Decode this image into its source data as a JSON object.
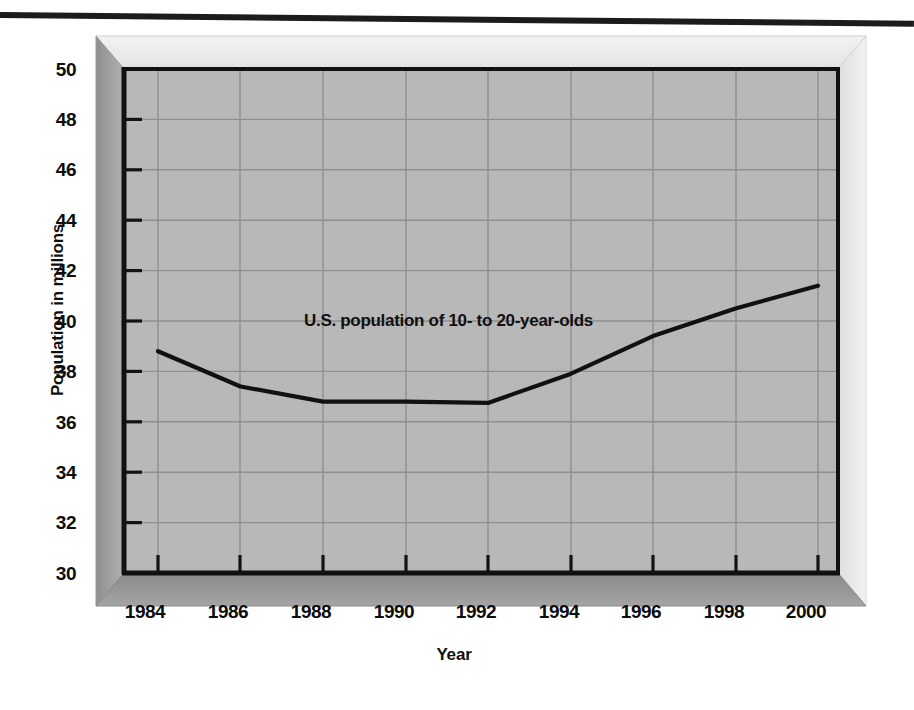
{
  "chart_data": {
    "type": "line",
    "title": "",
    "subtitle": "",
    "xlabel": "Year",
    "ylabel": "Population in millions",
    "x": [
      1984,
      1986,
      1988,
      1990,
      1992,
      1994,
      1996,
      1998,
      2000
    ],
    "xtick_labels": [
      "1984",
      "1986",
      "1988",
      "1990",
      "1992",
      "1994",
      "1996",
      "1998",
      "2000"
    ],
    "ytick_labels": [
      "50",
      "48",
      "46",
      "44",
      "42",
      "40",
      "38",
      "36",
      "34",
      "32",
      "30"
    ],
    "ytick_values": [
      50,
      48,
      46,
      44,
      42,
      40,
      38,
      36,
      34,
      32,
      30
    ],
    "xlim": [
      1983,
      2001
    ],
    "ylim": [
      30,
      50
    ],
    "grid": true,
    "legend_position": "none",
    "series": [
      {
        "name": "U.S. population of 10- to 20-year-olds",
        "values": [
          38.8,
          37.4,
          36.8,
          36.8,
          36.75,
          37.9,
          39.4,
          40.5,
          41.4
        ]
      }
    ],
    "annotations": [
      {
        "text": "U.S. population of 10- to 20-year-olds",
        "x": 1990,
        "y": 40.2
      }
    ],
    "colors": {
      "plot_background": "#b8b8b8",
      "gridline": "#8f8f8f",
      "series_line": "#111111",
      "axis": "#111111",
      "wall_left": "#9a9a9a",
      "floor": "#8e8e8e",
      "page_background": "#ffffff",
      "text": "#0d0d0d"
    }
  },
  "figure": {
    "top_rule_name": "horizontal-rule"
  }
}
